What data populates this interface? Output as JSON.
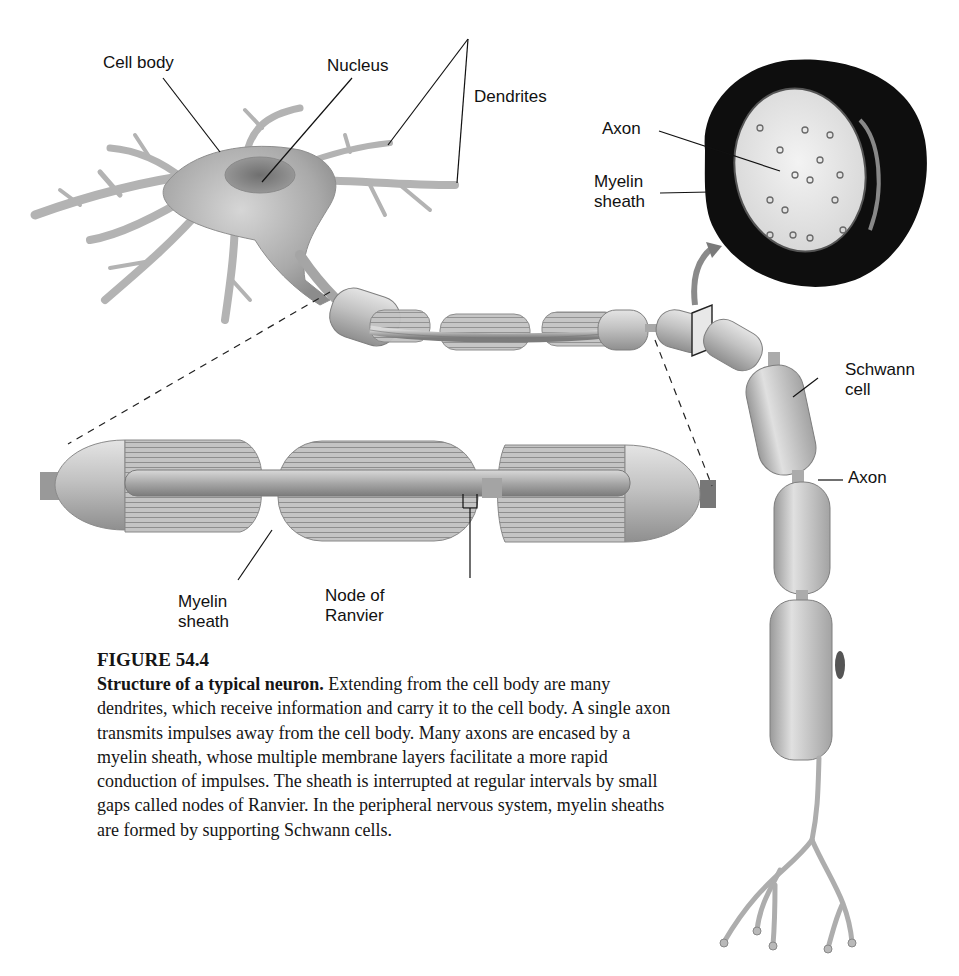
{
  "figure": {
    "number": "FIGURE 54.4",
    "title": "Structure of a typical neuron.",
    "body": " Extending from the cell body are many dendrites, which receive information and carry it to the cell body. A single axon transmits impulses away from the cell body. Many axons are encased by a myelin sheath, whose multiple membrane layers facilitate a more rapid conduction of impulses. The sheath is interrupted at regular intervals by small gaps called nodes of Ranvier. In the peripheral nervous system, myelin sheaths are formed by supporting Schwann cells."
  },
  "labels": {
    "cell_body": "Cell body",
    "nucleus": "Nucleus",
    "dendrites": "Dendrites",
    "cross_section_axon": "Axon",
    "cross_section_myelin": "Myelin\nsheath",
    "schwann_cell": "Schwann\ncell",
    "axon": "Axon",
    "enlarged_myelin": "Myelin\nsheath",
    "node_of_ranvier": "Node of\nRanvier"
  },
  "colors": {
    "background": "#ffffff",
    "cell_gray": "#b9b9b9",
    "cell_dark": "#7a7a7a",
    "myelin_dark": "#111111",
    "text": "#111111"
  }
}
